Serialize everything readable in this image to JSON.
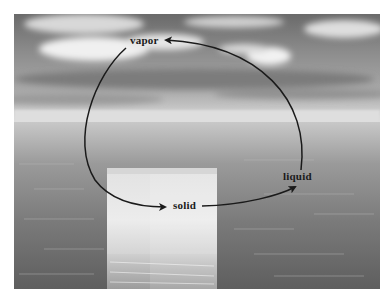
{
  "figure": {
    "labels": {
      "vapor": "vapor",
      "liquid": "liquid",
      "solid": "solid"
    },
    "cycle_arrows": [
      {
        "from": "vapor",
        "to": "solid"
      },
      {
        "from": "solid",
        "to": "liquid"
      },
      {
        "from": "liquid",
        "to": "vapor"
      }
    ],
    "colors": {
      "arrow": "#1a1a1a",
      "sky_dark": "#5a5a5a",
      "cloud": "#efefef",
      "horizon": "#d9d9d9",
      "sea": "#6e6e6e",
      "ice": "#e8e8e8"
    }
  }
}
